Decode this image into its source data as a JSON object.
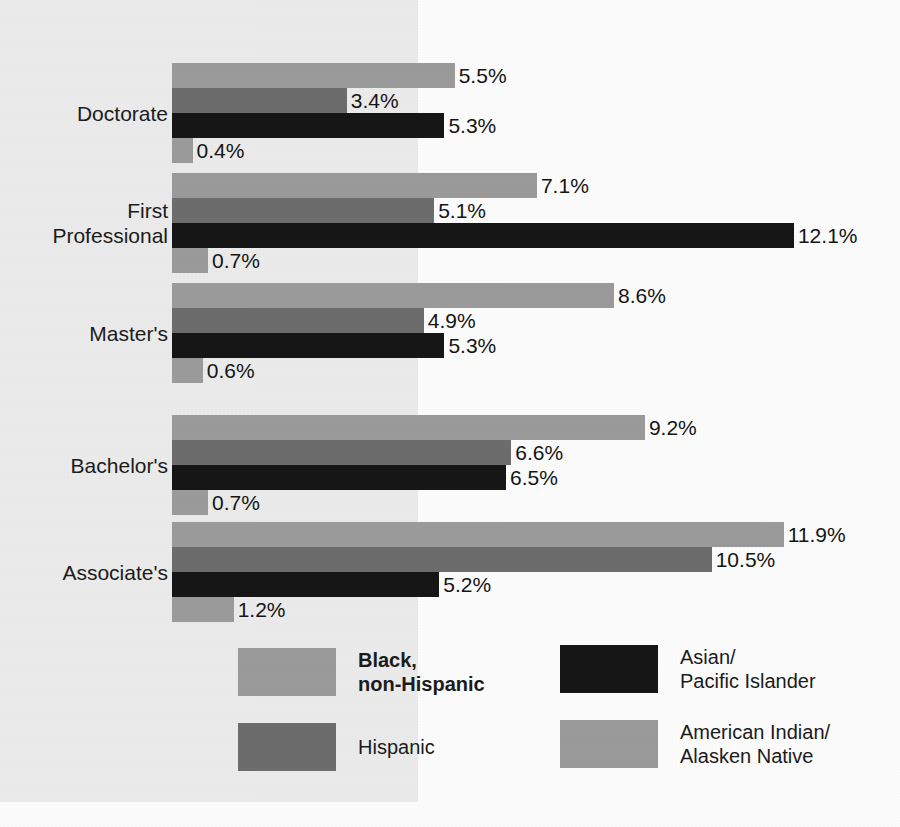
{
  "chart_data": {
    "type": "bar",
    "orientation": "horizontal",
    "title": "",
    "subtitle": "",
    "xlabel": "",
    "ylabel": "",
    "grid": false,
    "xlim": [
      0,
      12.1
    ],
    "value_suffix": "%",
    "legend_position": "bottom",
    "categories": [
      "Doctorate",
      "First\nProfessional",
      "Master's",
      "Bachelor's",
      "Associate's"
    ],
    "series": [
      {
        "name": "Black,\nnon-Hispanic",
        "color": "#9b9b9b",
        "values": [
          5.5,
          7.1,
          8.6,
          9.2,
          11.9
        ],
        "labels": [
          "5.5%",
          "7.1%",
          "8.6%",
          "9.2%",
          "11.9%"
        ]
      },
      {
        "name": "Hispanic",
        "color": "#6d6d6d",
        "values": [
          3.4,
          5.1,
          4.9,
          6.6,
          10.5
        ],
        "labels": [
          "3.4%",
          "5.1%",
          "4.9%",
          "6.6%",
          "10.5%"
        ]
      },
      {
        "name": "Asian/\nPacific Islander",
        "color": "#161616",
        "values": [
          5.3,
          12.1,
          5.3,
          6.5,
          5.2
        ],
        "labels": [
          "5.3%",
          "12.1%",
          "5.3%",
          "6.5%",
          "5.2%"
        ]
      },
      {
        "name": "American Indian/\nAlasken Native",
        "color": "#9b9b9b",
        "values": [
          0.4,
          0.7,
          0.6,
          0.7,
          1.2
        ],
        "labels": [
          "0.4%",
          "0.7%",
          "0.6%",
          "0.7%",
          "1.2%"
        ]
      }
    ]
  },
  "legend": {
    "items": [
      {
        "label": "Black,\nnon-Hispanic",
        "color": "#9b9b9b",
        "bold": true
      },
      {
        "label": "Hispanic",
        "color": "#6d6d6d",
        "bold": false
      },
      {
        "label": "Asian/\nPacific Islander",
        "color": "#161616",
        "bold": false
      },
      {
        "label": "American Indian/\nAlasken Native",
        "color": "#9b9b9b",
        "bold": false
      }
    ]
  },
  "panel": {
    "background_color": "#ececec",
    "page_background_color": "#fdfdfd"
  }
}
